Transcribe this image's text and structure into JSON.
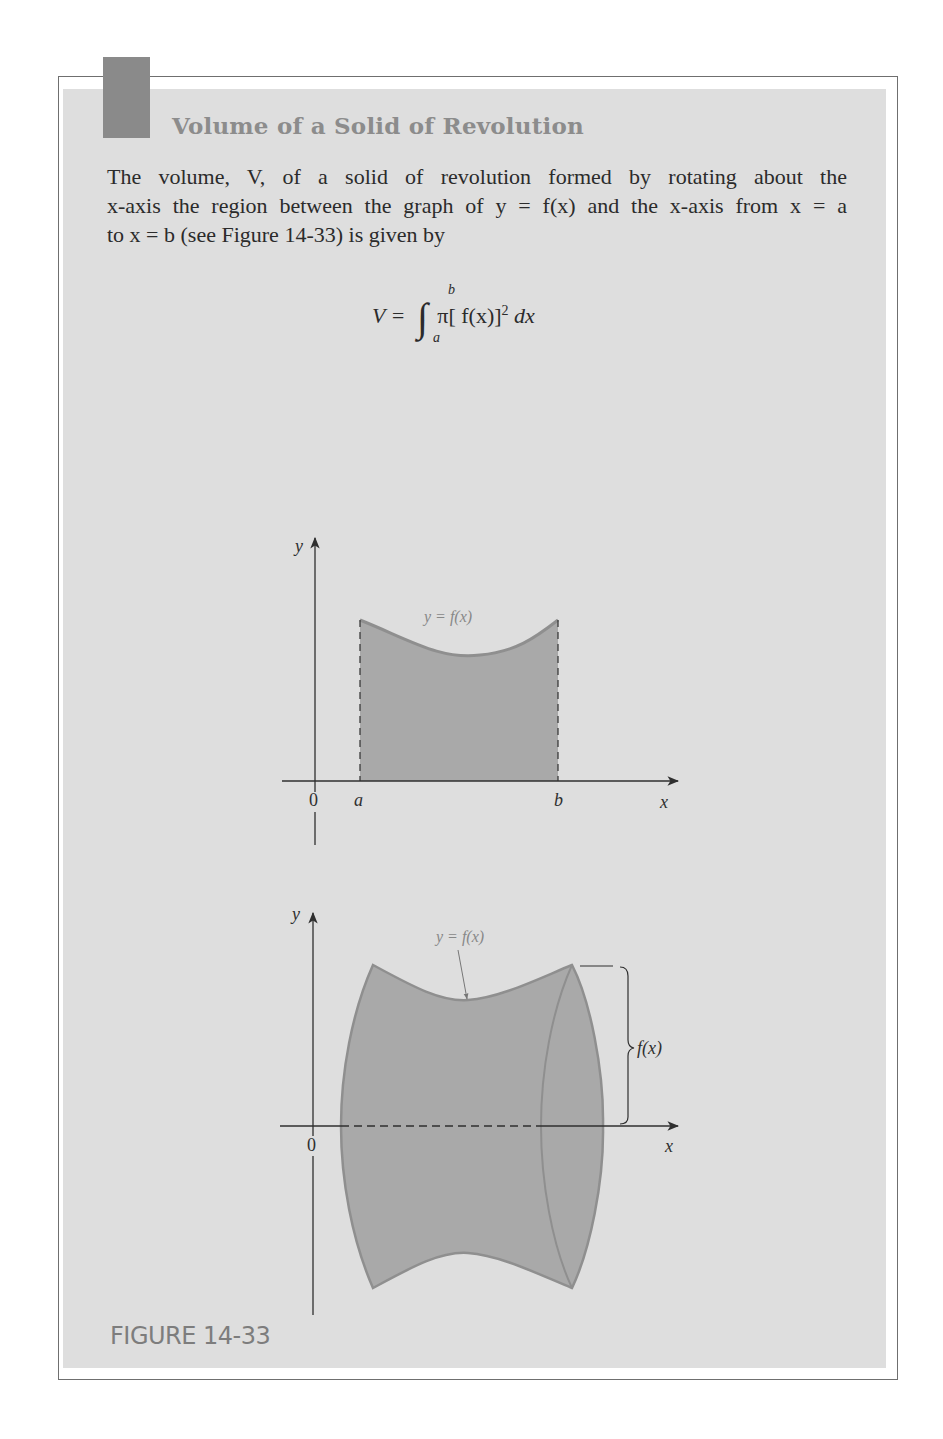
{
  "box": {
    "title": "Volume of a Solid of Revolution",
    "body_lines": [
      "The volume, V, of a solid of revolution formed by rotating about the",
      "x-axis the region between the graph of y = f(x) and the x-axis from x = a",
      "to x = b (see Figure 14-33) is given by"
    ],
    "formula": {
      "lhs": "V =",
      "integral_symbol": "∫",
      "lower_limit": "a",
      "upper_limit": "b",
      "integrand": "π[ f(x)]",
      "exponent": "2",
      "differential": "dx"
    }
  },
  "figure_top": {
    "y_axis_label": "y",
    "x_axis_label": "x",
    "origin_label": "0",
    "a_label": "a",
    "b_label": "b",
    "curve_label": "y = f(x)"
  },
  "figure_bottom": {
    "y_axis_label": "y",
    "x_axis_label": "x",
    "origin_label": "0",
    "curve_label": "y = f(x)",
    "radius_label": "f(x)"
  },
  "caption": "FIGURE 14-33",
  "colors": {
    "panel": "#dedede",
    "tab": "#8a8a8a",
    "title": "#8c8c8c",
    "region_fill": "#a9a9a9",
    "region_stroke": "#8f8f8f"
  }
}
